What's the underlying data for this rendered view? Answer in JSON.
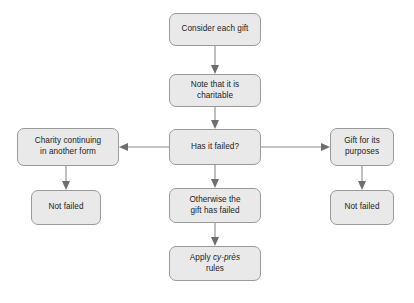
{
  "diagram": {
    "type": "flowchart",
    "background_color": "#ffffff",
    "node_fill_color": "#e9e9e9",
    "node_border_color": "#9a9a9a",
    "connector_color": "#8a8a8a",
    "text_color": "#1c1c1c",
    "nodes": [
      {
        "id": "consider",
        "label": "Consider each gift",
        "column": "center",
        "order": 1
      },
      {
        "id": "note",
        "label": "Note that it is\ncharitable",
        "column": "center",
        "order": 2
      },
      {
        "id": "hasfailed",
        "label": "Has it failed?",
        "column": "center",
        "order": 3
      },
      {
        "id": "otherwise",
        "label": "Otherwise the\ngift has failed",
        "column": "center",
        "order": 4
      },
      {
        "id": "cypres",
        "label_prefix": "Apply ",
        "label_italic": "cy-près",
        "label_suffix": "\nrules",
        "label": "Apply cy-près rules",
        "column": "center",
        "order": 5
      },
      {
        "id": "charity",
        "label": "Charity continuing\nin another form",
        "column": "left",
        "order": 1
      },
      {
        "id": "notfailed_left",
        "label": "Not failed",
        "column": "left",
        "order": 2
      },
      {
        "id": "gift",
        "label": "Gift for its\npurposes",
        "column": "right",
        "order": 1
      },
      {
        "id": "notfailed_right",
        "label": "Not failed",
        "column": "right",
        "order": 2
      }
    ],
    "edges": [
      {
        "from": "consider",
        "to": "note",
        "direction": "down"
      },
      {
        "from": "note",
        "to": "hasfailed",
        "direction": "down"
      },
      {
        "from": "hasfailed",
        "to": "charity",
        "direction": "left"
      },
      {
        "from": "hasfailed",
        "to": "gift",
        "direction": "right"
      },
      {
        "from": "hasfailed",
        "to": "otherwise",
        "direction": "down"
      },
      {
        "from": "otherwise",
        "to": "cypres",
        "direction": "down"
      },
      {
        "from": "charity",
        "to": "notfailed_left",
        "direction": "down"
      },
      {
        "from": "gift",
        "to": "notfailed_right",
        "direction": "down"
      }
    ]
  }
}
